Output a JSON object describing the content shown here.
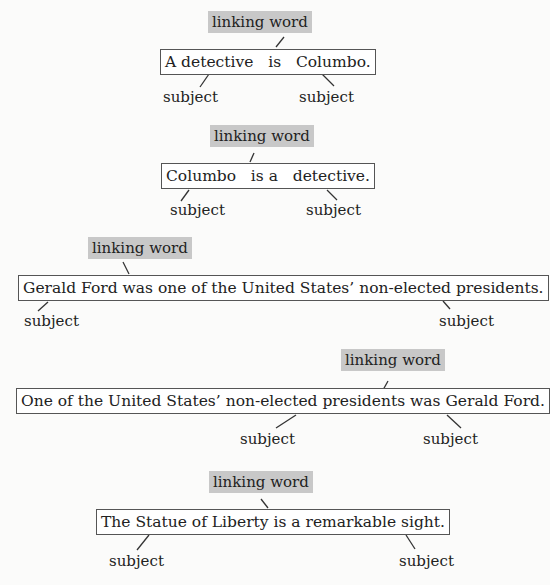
{
  "diagrams": [
    {
      "linking_label": "linking word",
      "sentence": "A detective   is   Columbo.",
      "subject_left": "subject",
      "subject_right": "subject"
    },
    {
      "linking_label": "linking word",
      "sentence": "Columbo   is a   detective.",
      "subject_left": "subject",
      "subject_right": "subject"
    },
    {
      "linking_label": "linking word",
      "sentence": "Gerald Ford was one of the United States’ non-elected presidents.",
      "subject_left": "subject",
      "subject_right": "subject"
    },
    {
      "linking_label": "linking word",
      "sentence": "One of the United States’ non-elected presidents was Gerald Ford.",
      "subject_left": "subject",
      "subject_right": "subject"
    },
    {
      "linking_label": "linking word",
      "sentence": "The Statue of Liberty is a remarkable sight.",
      "subject_left": "subject",
      "subject_right": "subject"
    }
  ]
}
